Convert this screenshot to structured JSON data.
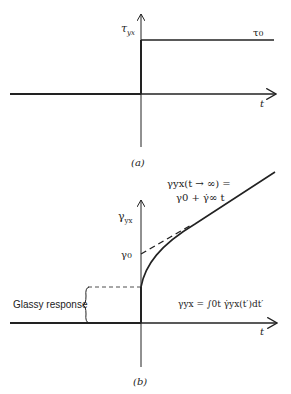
{
  "panel_a": {
    "y_axis_label": "τ",
    "y_axis_sub": "yx",
    "step_label": "τ",
    "step_sub": "0",
    "x_axis_label": "t",
    "caption": "(a)"
  },
  "panel_b": {
    "y_axis_label": "γ",
    "y_axis_sub": "yx",
    "intercept_label": "γ",
    "intercept_sub": "0",
    "asymptote_line1": "γyx(t → ∞) =",
    "asymptote_line2": "γ0 + γ̇∞ t",
    "glassy_label": "Glassy response",
    "integral_label": "γyx = ∫0t γ̇yx(t′)dt′",
    "x_axis_label": "t",
    "caption": "(b)"
  },
  "colors": {
    "line": "#222222",
    "background": "#ffffff"
  }
}
